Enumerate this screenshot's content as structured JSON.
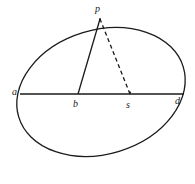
{
  "figure": {
    "type": "geometry-diagram",
    "stroke_color": "#1a1a1a",
    "background_color": "#ffffff",
    "labels": {
      "a": "a",
      "b": "b",
      "s": "s",
      "d": "d",
      "p": "p"
    },
    "geometry": {
      "ellipse": {
        "center_x": 101,
        "center_y": 92,
        "radius_x": 86,
        "radius_y": 62,
        "rotation_deg": -17
      },
      "chord": {
        "x1": 20,
        "y1": 94,
        "x2": 184,
        "y2": 94
      },
      "solid_segment": {
        "x1": 78,
        "y1": 94,
        "x2": 100,
        "y2": 19
      },
      "dashed_segment": {
        "x1": 130,
        "y1": 94,
        "x2": 100,
        "y2": 19
      },
      "points": {
        "a": {
          "x": 20,
          "y": 94
        },
        "b": {
          "x": 78,
          "y": 94
        },
        "s": {
          "x": 130,
          "y": 94
        },
        "d": {
          "x": 184,
          "y": 94
        },
        "p": {
          "x": 100,
          "y": 19
        }
      }
    }
  }
}
